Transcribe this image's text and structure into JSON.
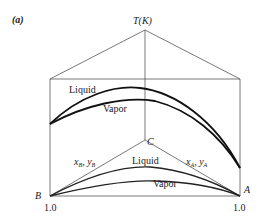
{
  "figure": {
    "panel_label": "(a)",
    "axis_label": "T(K)",
    "apex_label": "C",
    "corner_left": "B",
    "corner_right": "A",
    "tick_left": "1.0",
    "tick_right": "1.0",
    "upper_liquid_label": "Liquid",
    "upper_vapor_label": "Vapor",
    "lower_liquid_label": "Liquid",
    "lower_vapor_label": "Vapor",
    "left_composition_label": "x_B, y_B",
    "right_composition_label": "x_A, y_A"
  }
}
